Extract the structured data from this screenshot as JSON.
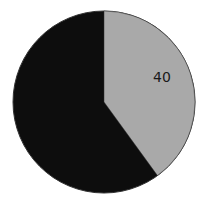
{
  "chart_data": {
    "type": "pie",
    "title": "",
    "categories": [
      "A",
      "B"
    ],
    "values": [
      40,
      60
    ],
    "colors": [
      "#a9a9a9",
      "#0d0d0d"
    ],
    "data_labels": [
      "40",
      "60"
    ],
    "start_angle_deg": 0,
    "direction": "clockwise",
    "legend": "none"
  },
  "labels": {
    "slice_a": "40",
    "slice_b": "60"
  }
}
